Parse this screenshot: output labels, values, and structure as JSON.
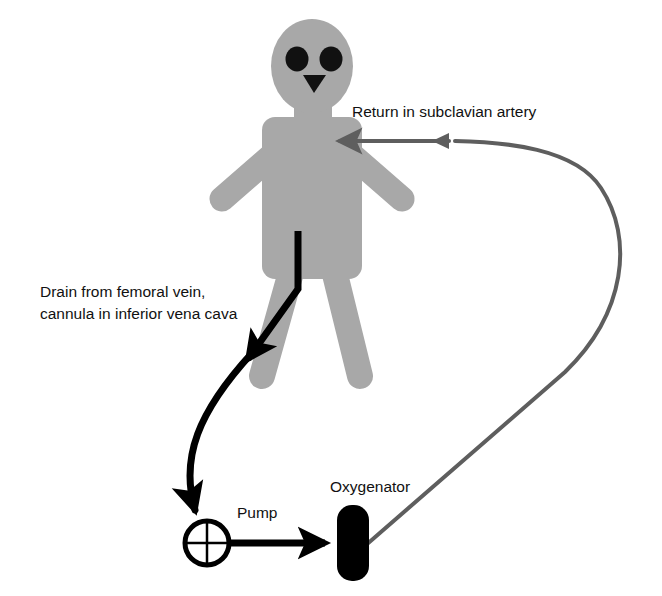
{
  "figure": {
    "type": "medical-schematic",
    "background_color": "#ffffff"
  },
  "colors": {
    "body_gray": "#a8a8a8",
    "venous_line_black": "#000000",
    "arterial_line_gray": "#5e5e5e",
    "text_black": "#111111",
    "device_black": "#000000"
  },
  "labels": {
    "return_subclavian": "Return in subclavian artery",
    "drain_line1": "Drain from femoral vein,",
    "drain_line2": "cannula in inferior vena cava",
    "pump": "Pump",
    "oxygenator": "Oxygenator"
  },
  "patient": {
    "name": "patient-figure",
    "head": {
      "cx": 312,
      "cy": 66,
      "rx": 41,
      "ry": 47
    },
    "eyes": [
      {
        "cx": 297,
        "cy": 60,
        "rx": 11,
        "ry": 12
      },
      {
        "cx": 330,
        "cy": 60,
        "rx": 11,
        "ry": 12
      }
    ],
    "nose": {
      "points": "304,76 325,76 314,93"
    },
    "neck": {
      "x": 293,
      "y": 104,
      "w": 40,
      "h": 22
    },
    "torso": {
      "x": 261,
      "y": 117,
      "w": 101,
      "h": 165,
      "radius": 12
    },
    "arm_left": {
      "x1": 268,
      "y1": 150,
      "x2": 224,
      "y2": 196
    },
    "arm_right": {
      "x1": 356,
      "y1": 150,
      "x2": 400,
      "y2": 196
    },
    "leg_left": {
      "x1": 295,
      "y1": 265,
      "x2": 263,
      "y2": 375
    },
    "leg_right": {
      "x1": 330,
      "y1": 265,
      "x2": 358,
      "y2": 375
    }
  },
  "devices": {
    "pump": {
      "name": "pump-symbol",
      "shape": "circle-with-crosshair",
      "cx": 207,
      "cy": 543,
      "r": 22,
      "label_x": 236,
      "label_y": 518
    },
    "oxygenator": {
      "name": "oxygenator-symbol",
      "shape": "rounded-rectangle-filled",
      "x": 336,
      "y": 505,
      "w": 32,
      "h": 75,
      "radius": 15,
      "label_x": 331,
      "label_y": 490
    }
  },
  "flow_paths": {
    "venous_drain": {
      "name": "venous-drain-path",
      "color": "#000000",
      "stroke_width": 7,
      "description": "From inferior vena cava cannula down to pump inlet",
      "cannula_segment": "M 298,230 L 298,287 L 245,360",
      "arrowhead_1": {
        "tip_x": 240,
        "tip_y": 366,
        "angle": 54
      },
      "curve_segment": "M 249,355 C 195,415 178,455 194,518",
      "arrowhead_2": {
        "tip_x": 196,
        "tip_y": 527,
        "angle": 95
      }
    },
    "pump_to_oxygenator": {
      "name": "pump-to-oxygenator-path",
      "color": "#000000",
      "stroke_width": 7,
      "path": "M 229,543 L 322,543",
      "arrowhead": {
        "tip_x": 337,
        "tip_y": 543,
        "angle": 0
      }
    },
    "arterial_return": {
      "name": "arterial-return-path",
      "color": "#5e5e5e",
      "stroke_width": 4,
      "description": "From oxygenator outlet, loops right and returns to subclavian artery",
      "path": "M 364,543 L 560,373 C 624,310 632,235 600,185 C 573,143 500,140 350,141",
      "arrowhead_mid": {
        "tip_x": 447,
        "tip_y": 141,
        "angle": 180
      },
      "arrowhead_end": {
        "tip_x": 332,
        "tip_y": 141,
        "angle": 180
      }
    }
  },
  "label_positions": {
    "return_subclavian": {
      "x": 352,
      "y": 117
    },
    "drain_line1": {
      "x": 40,
      "y": 297
    },
    "drain_line2": {
      "x": 40,
      "y": 318
    }
  }
}
